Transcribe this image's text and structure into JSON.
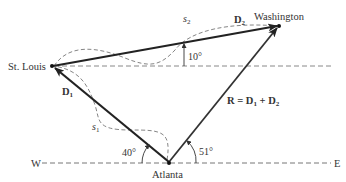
{
  "diagram": {
    "type": "vector-addition",
    "cities": {
      "st_louis": "St. Louis",
      "washington": "Washington",
      "atlanta": "Atlanta"
    },
    "directions": {
      "west": "W",
      "east": "E"
    },
    "vectors": {
      "d1": {
        "label": "D",
        "sub": "1"
      },
      "d2": {
        "label": "D",
        "sub": "2"
      },
      "resultant": {
        "label": "R = D",
        "sub1": "1",
        "plus": " + D",
        "sub2": "2"
      }
    },
    "paths": {
      "s1": {
        "label": "s",
        "sub": "1"
      },
      "s2": {
        "label": "s",
        "sub": "2"
      }
    },
    "angles": {
      "d2_angle": "10°",
      "d1_angle": "40°",
      "r_angle": "51°"
    },
    "colors": {
      "vector": "#222222",
      "dashed": "#777777",
      "text": "#333333"
    }
  }
}
